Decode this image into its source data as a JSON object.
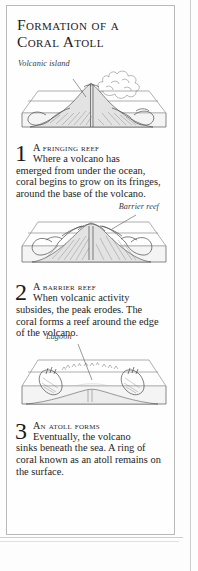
{
  "page": {
    "background_color": "#fdfdfd",
    "frame_color": "#b9b9b9"
  },
  "panel": {
    "title": "Formation of a Coral Atoll"
  },
  "figures": [
    {
      "name": "volcanic-island",
      "label": "Volcanic island",
      "caption_style": "italic"
    },
    {
      "name": "barrier-reef",
      "label": "Barrier reef",
      "caption_style": "italic"
    },
    {
      "name": "atoll-lagoon",
      "label": "Lagoon",
      "caption_style": "italic"
    }
  ],
  "steps": [
    {
      "number": "1",
      "heading": "A fringing reef",
      "line1": "Where a volcano has",
      "rest": "emerged from under the ocean, coral begins to grow on its fringes, around the base of the volcano."
    },
    {
      "number": "2",
      "heading": "A barrier reef",
      "line1": "When volcanic activity",
      "rest": "subsides, the peak erodes. The coral forms a reef around the edge of the volcano."
    },
    {
      "number": "3",
      "heading": "An atoll forms",
      "line1": "Eventually, the volcano",
      "rest": "sinks beneath the sea. A ring of coral known as an atoll remains on the surface."
    }
  ],
  "colors": {
    "ink": "#4a4a4a",
    "text": "#242424",
    "rule": "#cfcfcf",
    "land_fill": "#e3e3e3",
    "sea_fill": "#f4f4f4"
  }
}
